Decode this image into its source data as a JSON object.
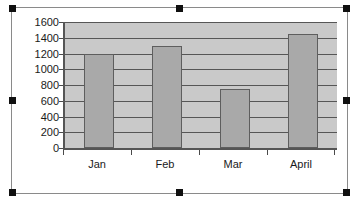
{
  "chart_data": {
    "type": "bar",
    "title": "",
    "subtitle": "",
    "xlabel": "",
    "ylabel": "",
    "categories": [
      "Jan",
      "Feb",
      "Mar",
      "April"
    ],
    "values": [
      1200,
      1300,
      750,
      1450
    ],
    "series": [
      {
        "name": "Series 1",
        "values": [
          1200,
          1300,
          750,
          1450
        ]
      }
    ],
    "ylim": [
      0,
      1600
    ],
    "ytick_step": 200,
    "yticks": [
      1600,
      1400,
      1200,
      1000,
      800,
      600,
      400,
      200,
      0
    ],
    "grid": "horizontal",
    "legend": "none",
    "annotations": []
  },
  "style": {
    "plot_background": "#c9c9c9",
    "bar_fill": "#a9a9a9",
    "bar_border": "#5e5e5e",
    "gridline_color": "#565656",
    "axis_color": "#555555",
    "text_color": "#1a1a1a",
    "canvas_background": "#ffffff",
    "selection_handle_color": "#101010",
    "frame_border": "#8a8a8a"
  },
  "selection": {
    "state": "selected",
    "handle_names": [
      "top-left",
      "top-center",
      "top-right",
      "middle-left",
      "middle-right",
      "bottom-left",
      "bottom-center",
      "bottom-right"
    ]
  },
  "top_artifact": {
    "text": ""
  }
}
